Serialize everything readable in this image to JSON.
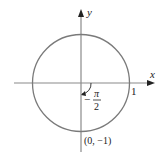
{
  "diagram": {
    "type": "unit-circle",
    "axes": {
      "x_label": "x",
      "y_label": "y"
    },
    "labels": {
      "x_intercept": "1",
      "angle_sign": "−",
      "angle_num": "π",
      "angle_den": "2",
      "point": "(0, −1)"
    },
    "colors": {
      "circle": "#7a7a7a",
      "axes": "#8a8a8a",
      "arrow": "#222222",
      "text": "#222222"
    }
  }
}
